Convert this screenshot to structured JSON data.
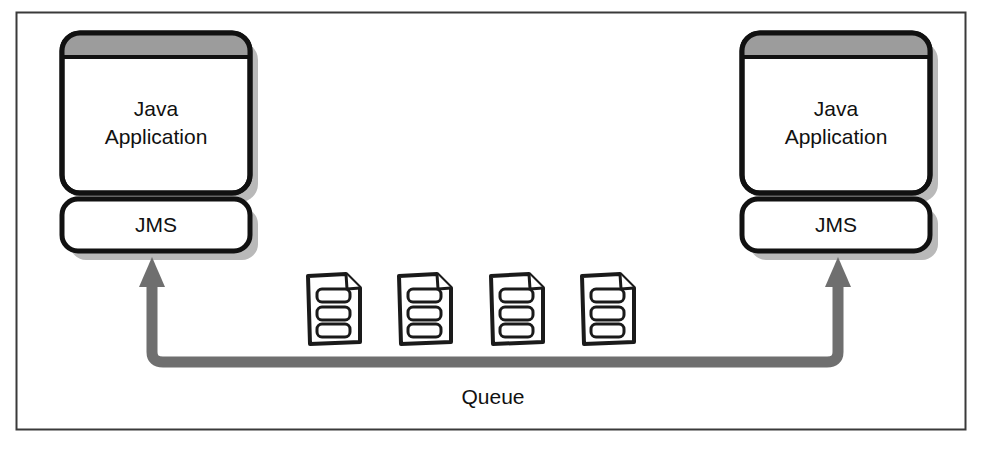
{
  "diagram": {
    "frame": {
      "border_color": "#2b2b2b",
      "background": "#ffffff"
    },
    "colors": {
      "outline": "#111111",
      "titlebar_fill": "#9c9c9c",
      "node_fill": "#ffffff",
      "shadow": "#b5b5b5",
      "arrow": "#6b6b6b",
      "text": "#111111",
      "icon_outline": "#1a1a1a",
      "icon_fill": "#ffffff"
    },
    "nodes": [
      {
        "id": "sender",
        "app_label_line1": "Java",
        "app_label_line2": "Application",
        "jms_label": "JMS",
        "side": "left"
      },
      {
        "id": "receiver",
        "app_label_line1": "Java",
        "app_label_line2": "Application",
        "jms_label": "JMS",
        "side": "right"
      }
    ],
    "queue": {
      "label": "Queue",
      "message_count": 4,
      "messages": [
        {
          "id": "message-1",
          "lines": 3
        },
        {
          "id": "message-2",
          "lines": 3
        },
        {
          "id": "message-3",
          "lines": 3
        },
        {
          "id": "message-4",
          "lines": 3
        }
      ]
    },
    "connectors": [
      {
        "id": "queue-path",
        "from": "queue",
        "to_left": "sender-jms",
        "to_right": "receiver-jms",
        "style": "thick-gray-double-arrow"
      }
    ]
  }
}
